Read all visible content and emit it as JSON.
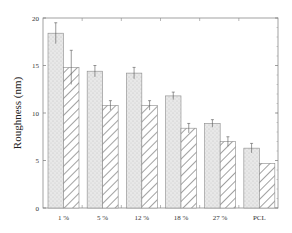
{
  "chart_data": {
    "type": "bar",
    "title": "",
    "xlabel": "",
    "ylabel": "Roughness (nm)",
    "ylim": [
      0,
      20
    ],
    "yticks": [
      0,
      5,
      10,
      15,
      20
    ],
    "grid": false,
    "legend": null,
    "categories": [
      "1 %",
      "5 %",
      "12 %",
      "18 %",
      "27 %",
      "PCL"
    ],
    "series": [
      {
        "name": "stippled",
        "pattern": "stipple-gray",
        "values": [
          18.4,
          14.4,
          14.2,
          11.8,
          8.9,
          6.3
        ],
        "errors": [
          1.1,
          0.6,
          0.6,
          0.4,
          0.4,
          0.5
        ]
      },
      {
        "name": "hatched",
        "pattern": "diagonal-hatch",
        "values": [
          14.8,
          10.8,
          10.8,
          8.4,
          7.0,
          4.7
        ],
        "errors": [
          1.8,
          0.5,
          0.5,
          0.5,
          0.5,
          0.0
        ]
      }
    ]
  },
  "axis": {
    "ylabel": "Roughness (nm)",
    "ytick_labels": [
      "0",
      "5",
      "10",
      "15",
      "20"
    ]
  },
  "colors": {
    "stipple_fill": "#e6e6e6",
    "stipple_dot": "#bdbdbd",
    "hatch_line": "#444444",
    "axis": "#777777",
    "bar_edge": "#8a8a8a"
  }
}
